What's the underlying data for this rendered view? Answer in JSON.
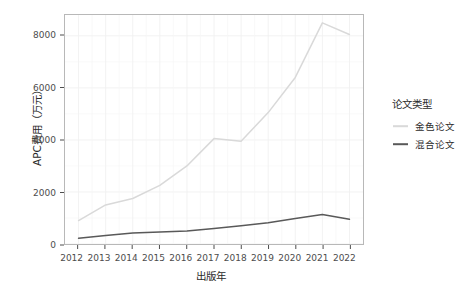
{
  "chart_data": {
    "type": "line",
    "title": "",
    "subtitle": "",
    "xlabel": "出版年",
    "ylabel": "APC费用（万元）",
    "x": [
      2012,
      2013,
      2014,
      2015,
      2016,
      2017,
      2018,
      2019,
      2020,
      2021,
      2022
    ],
    "categories": [
      "2012",
      "2013",
      "2014",
      "2015",
      "2016",
      "2017",
      "2018",
      "2019",
      "2020",
      "2021",
      "2022"
    ],
    "series": [
      {
        "name": "金色论文",
        "color": "#d9d9d9",
        "values": [
          900,
          1500,
          1750,
          2250,
          3000,
          4050,
          3950,
          5050,
          6400,
          8500,
          8050
        ]
      },
      {
        "name": "混合论文",
        "color": "#595959",
        "values": [
          220,
          330,
          420,
          460,
          500,
          600,
          700,
          820,
          980,
          1130,
          950
        ]
      }
    ],
    "xlim": [
      2011.5,
      2022.5
    ],
    "ylim": [
      0,
      8800
    ],
    "yticks": [
      0,
      2000,
      4000,
      6000,
      8000
    ],
    "ytick_labels": [
      "0",
      "2000",
      "4000",
      "6000",
      "8000"
    ],
    "xticks": [
      2012,
      2013,
      2014,
      2015,
      2016,
      2017,
      2018,
      2019,
      2020,
      2021,
      2022
    ],
    "grid": true,
    "grid_major_color": "#f0f0f0",
    "grid_minor_color": "#f7f7f7",
    "panel_background": "#ffffff",
    "panel_border_color": "#b8b8b8",
    "legend_position": "right"
  },
  "legend": {
    "title": "论文类型",
    "items": [
      {
        "label": "金色论文",
        "color": "#d9d9d9"
      },
      {
        "label": "混合论文",
        "color": "#595959"
      }
    ]
  },
  "axes": {
    "y_title": "APC费用（万元）",
    "x_title": "出版年",
    "y_tick_labels": [
      "8000",
      "6000",
      "4000",
      "2000",
      "0"
    ],
    "x_tick_labels": [
      "2012",
      "2013",
      "2014",
      "2015",
      "2016",
      "2017",
      "2018",
      "2019",
      "2020",
      "2021",
      "2022"
    ]
  }
}
